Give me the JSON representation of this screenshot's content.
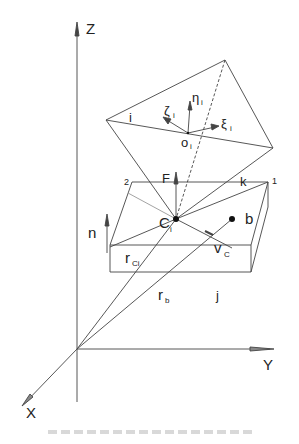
{
  "figure": {
    "axes": {
      "z_label": "Z",
      "y_label": "Y",
      "x_label": "X"
    },
    "labels": {
      "top_vertex": "i",
      "origin": "o",
      "origin_sub": "i",
      "eta": "η",
      "eta_sub": "i",
      "zeta": "ζ",
      "zeta_sub": "i",
      "xi": "ξ",
      "xi_sub": "i",
      "force": "F",
      "corner_2": "2",
      "corner_1": "1",
      "edge_k": "k",
      "normal": "n",
      "contact_point": "C",
      "contact_sub": "i",
      "body_point": "b",
      "velocity": "v",
      "velocity_sub": "C",
      "r_ci": "r",
      "r_ci_sub": "Ci",
      "r_b": "r",
      "r_b_sub": "b",
      "block_face": "j"
    },
    "caption": {
      "text": "[caption illegible at this resolution]",
      "legible": false
    }
  }
}
